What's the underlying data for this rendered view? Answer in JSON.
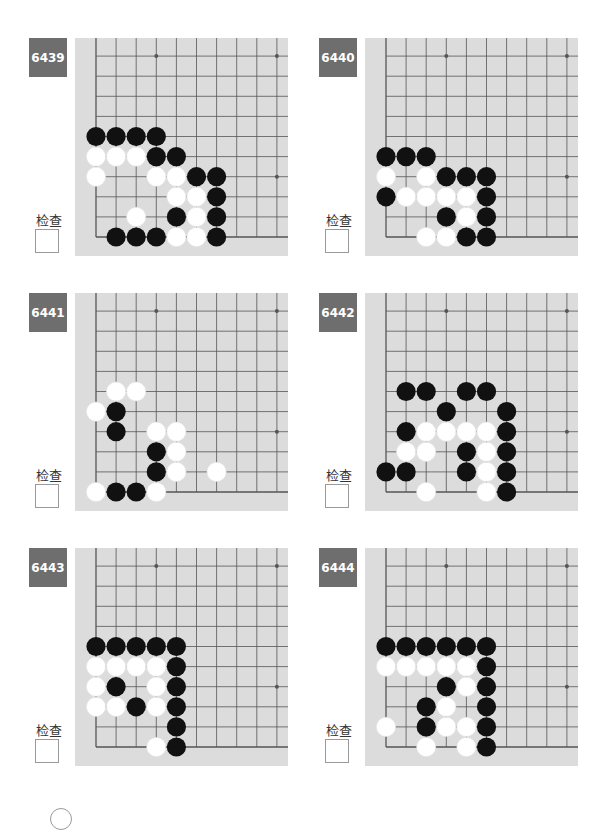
{
  "check_label": "检查",
  "colors": {
    "label_bg": "#6e6e6e",
    "board_bg": "#dcdcdc",
    "grid": "#555555",
    "black": "#111111",
    "white": "#ffffff"
  },
  "problems": [
    {
      "number": "6439",
      "black": [
        [
          0,
          5
        ],
        [
          1,
          5
        ],
        [
          2,
          5
        ],
        [
          3,
          5
        ],
        [
          3,
          4
        ],
        [
          4,
          4
        ],
        [
          5,
          3
        ],
        [
          6,
          3
        ],
        [
          6,
          2
        ],
        [
          4,
          1
        ],
        [
          6,
          1
        ],
        [
          1,
          0
        ],
        [
          2,
          0
        ],
        [
          3,
          0
        ],
        [
          6,
          0
        ]
      ],
      "white": [
        [
          0,
          4
        ],
        [
          1,
          4
        ],
        [
          2,
          4
        ],
        [
          0,
          3
        ],
        [
          3,
          3
        ],
        [
          4,
          3
        ],
        [
          4,
          2
        ],
        [
          5,
          2
        ],
        [
          2,
          1
        ],
        [
          5,
          1
        ],
        [
          4,
          0
        ],
        [
          5,
          0
        ]
      ]
    },
    {
      "number": "6440",
      "black": [
        [
          0,
          4
        ],
        [
          1,
          4
        ],
        [
          2,
          4
        ],
        [
          3,
          3
        ],
        [
          4,
          3
        ],
        [
          5,
          3
        ],
        [
          0,
          2
        ],
        [
          5,
          2
        ],
        [
          3,
          1
        ],
        [
          5,
          1
        ],
        [
          4,
          0
        ],
        [
          5,
          0
        ]
      ],
      "white": [
        [
          0,
          3
        ],
        [
          2,
          3
        ],
        [
          1,
          2
        ],
        [
          2,
          2
        ],
        [
          3,
          2
        ],
        [
          4,
          2
        ],
        [
          4,
          1
        ],
        [
          2,
          0
        ],
        [
          3,
          0
        ]
      ]
    },
    {
      "number": "6441",
      "black": [
        [
          1,
          4
        ],
        [
          1,
          3
        ],
        [
          3,
          2
        ],
        [
          3,
          1
        ],
        [
          1,
          0
        ],
        [
          2,
          0
        ]
      ],
      "white": [
        [
          1,
          5
        ],
        [
          2,
          5
        ],
        [
          0,
          4
        ],
        [
          3,
          3
        ],
        [
          4,
          3
        ],
        [
          4,
          2
        ],
        [
          4,
          1
        ],
        [
          6,
          1
        ],
        [
          0,
          0
        ],
        [
          3,
          0
        ]
      ]
    },
    {
      "number": "6442",
      "black": [
        [
          1,
          5
        ],
        [
          2,
          5
        ],
        [
          4,
          5
        ],
        [
          5,
          5
        ],
        [
          3,
          4
        ],
        [
          6,
          4
        ],
        [
          1,
          3
        ],
        [
          6,
          3
        ],
        [
          4,
          2
        ],
        [
          6,
          2
        ],
        [
          0,
          1
        ],
        [
          1,
          1
        ],
        [
          4,
          1
        ],
        [
          6,
          1
        ],
        [
          6,
          0
        ]
      ],
      "white": [
        [
          2,
          3
        ],
        [
          3,
          3
        ],
        [
          4,
          3
        ],
        [
          5,
          3
        ],
        [
          1,
          2
        ],
        [
          2,
          2
        ],
        [
          5,
          2
        ],
        [
          5,
          1
        ],
        [
          2,
          0
        ],
        [
          5,
          0
        ]
      ]
    },
    {
      "number": "6443",
      "black": [
        [
          0,
          5
        ],
        [
          1,
          5
        ],
        [
          2,
          5
        ],
        [
          3,
          5
        ],
        [
          4,
          5
        ],
        [
          4,
          4
        ],
        [
          1,
          3
        ],
        [
          4,
          3
        ],
        [
          2,
          2
        ],
        [
          4,
          2
        ],
        [
          4,
          1
        ],
        [
          4,
          0
        ]
      ],
      "white": [
        [
          0,
          4
        ],
        [
          1,
          4
        ],
        [
          2,
          4
        ],
        [
          3,
          4
        ],
        [
          0,
          3
        ],
        [
          3,
          3
        ],
        [
          0,
          2
        ],
        [
          1,
          2
        ],
        [
          3,
          2
        ],
        [
          3,
          0
        ]
      ]
    },
    {
      "number": "6444",
      "black": [
        [
          0,
          5
        ],
        [
          1,
          5
        ],
        [
          2,
          5
        ],
        [
          3,
          5
        ],
        [
          4,
          5
        ],
        [
          5,
          5
        ],
        [
          5,
          4
        ],
        [
          3,
          3
        ],
        [
          5,
          3
        ],
        [
          2,
          2
        ],
        [
          5,
          2
        ],
        [
          2,
          1
        ],
        [
          5,
          1
        ],
        [
          5,
          0
        ]
      ],
      "white": [
        [
          0,
          4
        ],
        [
          1,
          4
        ],
        [
          2,
          4
        ],
        [
          3,
          4
        ],
        [
          4,
          4
        ],
        [
          4,
          3
        ],
        [
          3,
          2
        ],
        [
          0,
          1
        ],
        [
          3,
          1
        ],
        [
          4,
          1
        ],
        [
          2,
          0
        ],
        [
          4,
          0
        ]
      ]
    }
  ]
}
